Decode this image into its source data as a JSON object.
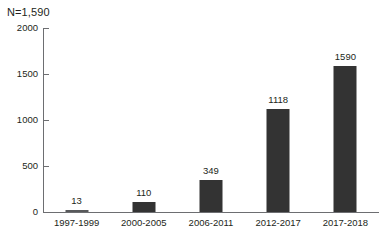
{
  "annotation": {
    "n_label": "N=1,590"
  },
  "chart_data": {
    "type": "bar",
    "title": "",
    "subtitle": "",
    "xlabel": "",
    "ylabel": "",
    "categories": [
      "1997-1999",
      "2000-2005",
      "2006-2011",
      "2012-2017",
      "2017-2018"
    ],
    "values": [
      13,
      110,
      349,
      1118,
      1590
    ],
    "data_labels": [
      "13",
      "110",
      "349",
      "1118",
      "1590"
    ],
    "ylim": [
      0,
      2000
    ],
    "ytick_labels": [
      "0",
      "500",
      "1000",
      "1500",
      "2000"
    ],
    "ytick_values": [
      0,
      500,
      1000,
      1500,
      2000
    ],
    "grid": false,
    "legend": null,
    "bar_color": "#333333",
    "axis_color": "#6d6e71",
    "background": "#ffffff",
    "annotations": [
      "N=1,590"
    ]
  }
}
